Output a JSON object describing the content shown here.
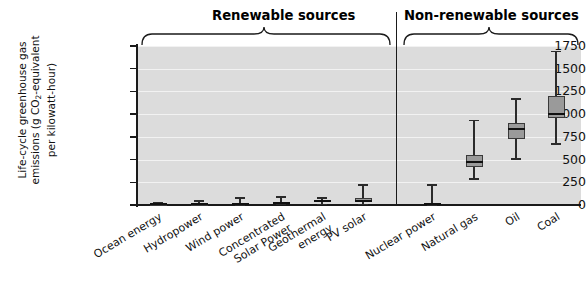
{
  "chart_data": {
    "type": "box",
    "title": "",
    "ylabel": "Life-cycle greenhouse gas emissions (g CO2-equivalent per kilowatt-hour)",
    "xlabel": "",
    "ylim": [
      0,
      1750
    ],
    "yticks": [
      0,
      250,
      500,
      750,
      1000,
      1250,
      1500,
      1750
    ],
    "grid": true,
    "legend": null,
    "groups": [
      {
        "label": "Renewable sources",
        "categories": [
          "Ocean energy",
          "Hydropower",
          "Wind power",
          "Concentrated Solar Power",
          "Geothermal energy",
          "PV solar"
        ]
      },
      {
        "label": "Non-renewable sources",
        "categories": [
          "Nuclear power",
          "Natural gas",
          "Oil",
          "Coal"
        ]
      }
    ],
    "categories": [
      "Ocean energy",
      "Hydropower",
      "Wind power",
      "Concentrated Solar Power",
      "Geothermal energy",
      "PV solar",
      "Nuclear power",
      "Natural gas",
      "Oil",
      "Coal"
    ],
    "boxes": [
      {
        "name": "Ocean energy",
        "min": 2,
        "q1": 4,
        "median": 8,
        "q3": 12,
        "max": 23
      },
      {
        "name": "Hydropower",
        "min": 1,
        "q1": 4,
        "median": 7,
        "q3": 14,
        "max": 45
      },
      {
        "name": "Wind power",
        "min": 2,
        "q1": 8,
        "median": 12,
        "q3": 20,
        "max": 81
      },
      {
        "name": "Concentrated Solar Power",
        "min": 7,
        "q1": 14,
        "median": 22,
        "q3": 32,
        "max": 89
      },
      {
        "name": "Geothermal energy",
        "min": 6,
        "q1": 30,
        "median": 45,
        "q3": 57,
        "max": 79
      },
      {
        "name": "PV solar",
        "min": 5,
        "q1": 44,
        "median": 46,
        "q3": 80,
        "max": 217
      },
      {
        "name": "Nuclear power",
        "min": 4,
        "q1": 8,
        "median": 16,
        "q3": 25,
        "max": 220
      },
      {
        "name": "Natural gas",
        "min": 290,
        "q1": 422,
        "median": 469,
        "q3": 548,
        "max": 930
      },
      {
        "name": "Oil",
        "min": 510,
        "q1": 722,
        "median": 840,
        "q3": 907,
        "max": 1170
      },
      {
        "name": "Coal",
        "min": 675,
        "q1": 960,
        "median": 1001,
        "q3": 1205,
        "max": 1689
      }
    ]
  },
  "axis": {
    "y_title_line1": "Life-cycle greenhouse gas",
    "y_title_line2a": "emissions (g CO",
    "y_title_sub": "2",
    "y_title_line2b": "-equivalent",
    "y_title_line3": "per kilowatt-hour)",
    "tick_labels": [
      "1750",
      "1500",
      "1250",
      "1000",
      "750",
      "500",
      "250",
      "0"
    ]
  },
  "headers": {
    "renewable": "Renewable sources",
    "non_renewable": "Non-renewable sources"
  },
  "x_labels": [
    "Ocean energy",
    "Hydropower",
    "Wind power",
    "Concentrated\nSolar Power",
    "Geothermal\nenergy",
    "PV solar",
    "Nuclear power",
    "Natural gas",
    "Oil",
    "Coal"
  ],
  "colors": {
    "plot_background": "#dcdcdc",
    "gridline": "#f2f2f2",
    "box_fill": "#9a9a9a",
    "box_stroke": "#3a3a3a",
    "axis": "#1a1a1a",
    "text": "#111111"
  }
}
